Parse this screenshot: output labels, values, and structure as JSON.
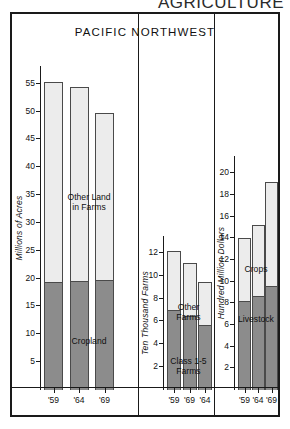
{
  "page": {
    "header_title": "AGRICULTURE",
    "chart_title": "PACIFIC NORTHWEST"
  },
  "panels": [
    {
      "id": "land-in-farms",
      "axis_title": "Millions of Acres",
      "ticks": [
        5,
        10,
        15,
        20,
        25,
        30,
        35,
        40,
        45,
        50,
        55
      ],
      "axis_max": 58,
      "years": [
        "'59",
        "'64",
        "'69"
      ],
      "upper_label": "Other Land\nin Farms",
      "lower_label": "Cropland",
      "totals": [
        55.3,
        54.4,
        49.8
      ],
      "lower_values": [
        19.4,
        19.6,
        19.8
      ]
    },
    {
      "id": "number-of-farms",
      "axis_title": "Ten Thousand Farms",
      "ticks": [
        2,
        4,
        6,
        8,
        10,
        12
      ],
      "axis_max": 13.4,
      "years": [
        "'59",
        "'69",
        "'64"
      ],
      "upper_label": "Other Farms",
      "lower_label": "Class 1-5\nFarms",
      "totals": [
        12.2,
        11.1,
        9.5
      ],
      "lower_values": [
        7.0,
        6.5,
        5.7
      ]
    },
    {
      "id": "farm-marketings",
      "axis_title": "Hundred Million Dollars",
      "ticks": [
        2,
        4,
        6,
        8,
        10,
        12,
        14,
        16,
        18,
        20
      ],
      "axis_max": 21.5,
      "years": [
        "'59",
        "'64",
        "'69"
      ],
      "upper_label": "Crops",
      "lower_label": "Livestock",
      "totals": [
        14.0,
        15.2,
        19.2
      ],
      "lower_values": [
        8.2,
        8.7,
        9.6
      ]
    }
  ],
  "colors": {
    "frame": "#1a1a1a",
    "bar_outline": "#4a4a4a",
    "segment_upper": "#ececec",
    "segment_lower": "#8c8c8c",
    "text": "#111111",
    "background": "#ffffff"
  },
  "chart_data": {
    "type": "bar",
    "title": "PACIFIC NORTHWEST",
    "subtitle": "AGRICULTURE",
    "layout": "three side-by-side stacked-bar panels",
    "grid": false,
    "legend": "in-panel segment labels",
    "panels": [
      {
        "name": "Land in Farms",
        "ylabel": "Millions of Acres",
        "ylim": [
          0,
          58
        ],
        "ytick_step": 5,
        "yticks": [
          5,
          10,
          15,
          20,
          25,
          30,
          35,
          40,
          45,
          50,
          55
        ],
        "categories": [
          "'59",
          "'64",
          "'69"
        ],
        "series": [
          {
            "name": "Cropland",
            "values": [
              19.4,
              19.6,
              19.8
            ],
            "shade": "dark"
          },
          {
            "name": "Other Land in Farms",
            "values": [
              35.9,
              34.8,
              30.0
            ],
            "shade": "light"
          }
        ],
        "totals": [
          55.3,
          54.4,
          49.8
        ]
      },
      {
        "name": "Number of Farms",
        "ylabel": "Ten Thousand Farms",
        "ylim": [
          0,
          13.4
        ],
        "ytick_step": 2,
        "yticks": [
          2,
          4,
          6,
          8,
          10,
          12
        ],
        "categories": [
          "'59",
          "'69",
          "'64"
        ],
        "series": [
          {
            "name": "Class 1-5 Farms",
            "values": [
              7.0,
              6.5,
              5.7
            ],
            "shade": "dark"
          },
          {
            "name": "Other Farms",
            "values": [
              5.2,
              4.6,
              3.8
            ],
            "shade": "light"
          }
        ],
        "totals": [
          12.2,
          11.1,
          9.5
        ]
      },
      {
        "name": "Farm Marketings",
        "ylabel": "Hundred Million Dollars",
        "ylim": [
          0,
          21.5
        ],
        "ytick_step": 2,
        "yticks": [
          2,
          4,
          6,
          8,
          10,
          12,
          14,
          16,
          18,
          20
        ],
        "categories": [
          "'59",
          "'64",
          "'69"
        ],
        "series": [
          {
            "name": "Livestock",
            "values": [
              8.2,
              8.7,
              9.6
            ],
            "shade": "dark"
          },
          {
            "name": "Crops",
            "values": [
              5.8,
              6.5,
              9.6
            ],
            "shade": "light"
          }
        ],
        "totals": [
          14.0,
          15.2,
          19.2
        ]
      }
    ]
  }
}
